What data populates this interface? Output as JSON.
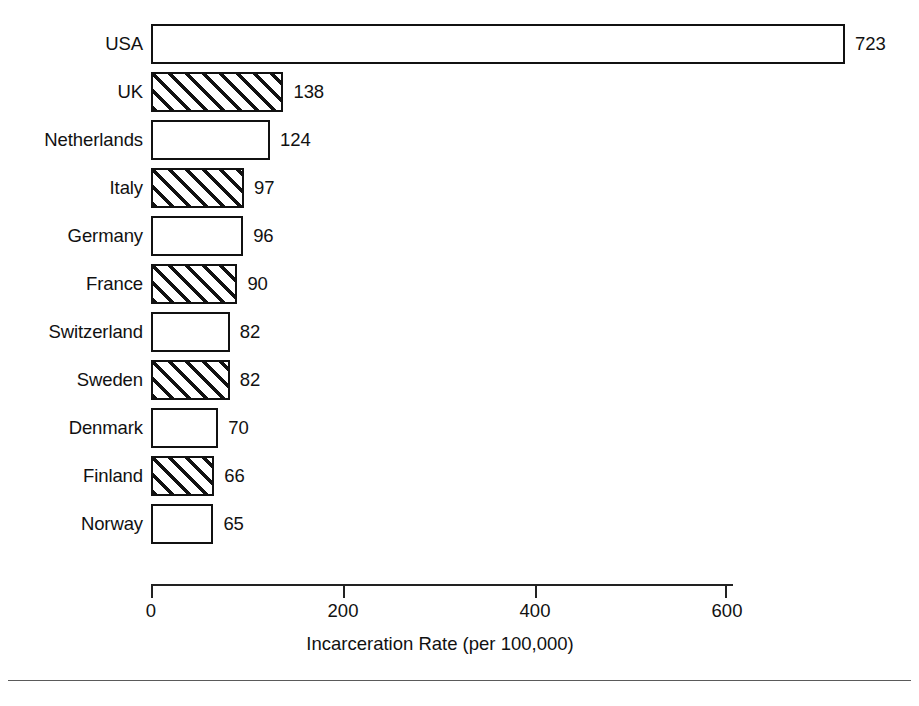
{
  "chart_data": {
    "type": "bar",
    "orientation": "horizontal",
    "title": "",
    "xlabel": "Incarceration Rate (per 100,000)",
    "ylabel": "",
    "categories": [
      "USA",
      "UK",
      "Netherlands",
      "Italy",
      "Germany",
      "France",
      "Switzerland",
      "Sweden",
      "Denmark",
      "Finland",
      "Norway"
    ],
    "values": [
      723,
      138,
      124,
      97,
      96,
      90,
      82,
      82,
      70,
      66,
      65
    ],
    "value_labels": [
      "723",
      "138",
      "124",
      "97",
      "96",
      "90",
      "82",
      "82",
      "70",
      "66",
      "65"
    ],
    "bar_styles": [
      "plain",
      "hatched",
      "plain",
      "hatched",
      "plain",
      "hatched",
      "plain",
      "hatched",
      "plain",
      "hatched",
      "plain"
    ],
    "xlim": [
      0,
      600
    ],
    "xticks": [
      0,
      200,
      400,
      600
    ],
    "xtick_labels": [
      "0",
      "200",
      "400",
      "600"
    ],
    "grid": false,
    "legend": null,
    "bar_outline_color": "#111111",
    "bar_fill_color": "#ffffff",
    "hatch_color": "#111111",
    "background_color": "#ffffff"
  },
  "axis": {
    "title": "Incarceration Rate (per 100,000)",
    "ticks": [
      {
        "label": "0",
        "value": 0
      },
      {
        "label": "200",
        "value": 200
      },
      {
        "label": "400",
        "value": 400
      },
      {
        "label": "600",
        "value": 600
      }
    ]
  },
  "bars": [
    {
      "label": "USA",
      "value": 723,
      "value_label": "723",
      "style": "plain"
    },
    {
      "label": "UK",
      "value": 138,
      "value_label": "138",
      "style": "hatched"
    },
    {
      "label": "Netherlands",
      "value": 124,
      "value_label": "124",
      "style": "plain"
    },
    {
      "label": "Italy",
      "value": 97,
      "value_label": "97",
      "style": "hatched"
    },
    {
      "label": "Germany",
      "value": 96,
      "value_label": "96",
      "style": "plain"
    },
    {
      "label": "France",
      "value": 90,
      "value_label": "90",
      "style": "hatched"
    },
    {
      "label": "Switzerland",
      "value": 82,
      "value_label": "82",
      "style": "plain"
    },
    {
      "label": "Sweden",
      "value": 82,
      "value_label": "82",
      "style": "hatched"
    },
    {
      "label": "Denmark",
      "value": 70,
      "value_label": "70",
      "style": "plain"
    },
    {
      "label": "Finland",
      "value": 66,
      "value_label": "66",
      "style": "hatched"
    },
    {
      "label": "Norway",
      "value": 65,
      "value_label": "65",
      "style": "plain"
    }
  ],
  "footer": {
    "caption": ""
  },
  "geometry": {
    "origin_x": 151,
    "px_per_unit": 0.96,
    "row_pitch": 48,
    "first_row_top": 20,
    "bar_height": 40
  }
}
